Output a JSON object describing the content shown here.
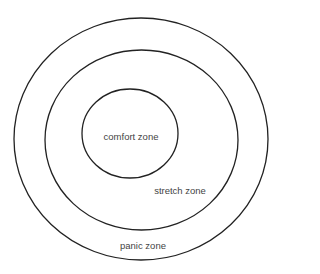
{
  "diagram": {
    "type": "concentric-zones",
    "zones": [
      {
        "id": "panic",
        "label": "panic zone",
        "ellipse": {
          "cx": 141,
          "cy": 139,
          "rx": 127,
          "ry": 121
        },
        "label_pos": {
          "x": 143,
          "y": 245
        }
      },
      {
        "id": "stretch",
        "label": "stretch zone",
        "ellipse": {
          "cx": 141.5,
          "cy": 140,
          "rx": 96.5,
          "ry": 90
        },
        "label_pos": {
          "x": 180,
          "y": 190
        }
      },
      {
        "id": "comfort",
        "label": "comfort zone",
        "ellipse": {
          "cx": 130,
          "cy": 133.5,
          "rx": 48,
          "ry": 44.5
        },
        "label_pos": {
          "x": 131,
          "y": 136
        }
      }
    ],
    "stroke_color": "#222222",
    "text_color": "#444444",
    "background": "#ffffff"
  }
}
